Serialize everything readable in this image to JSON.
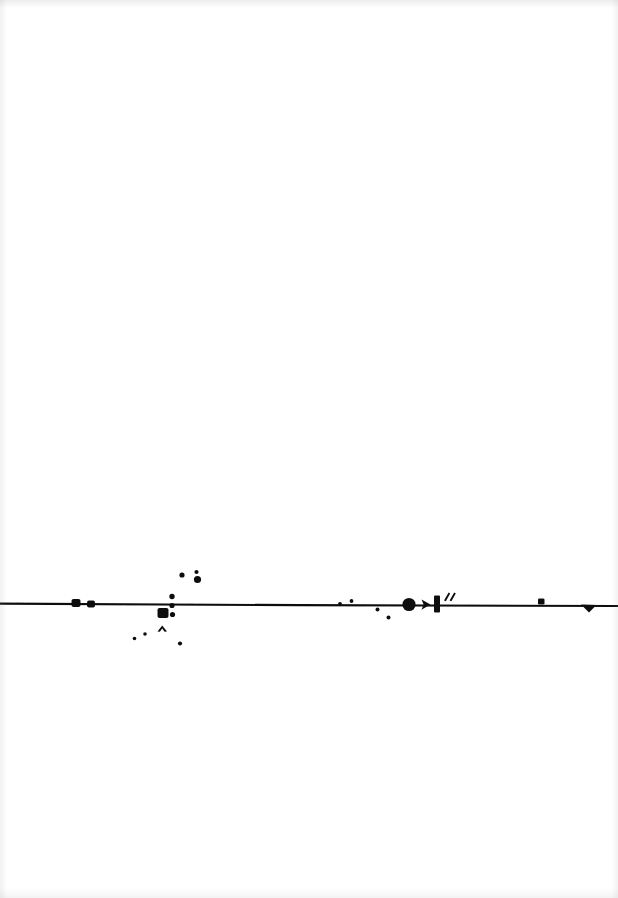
{
  "page": {
    "kind": "scanned-page",
    "width": 618,
    "height": 898,
    "background_color": "#ffffff",
    "ink_color": "#111111",
    "visible_text": "",
    "caption": ""
  },
  "artwork": {
    "title": "",
    "description": "horizontal ink rule with scattered blots",
    "baseline": {
      "name": "horizontal-rule",
      "x1": 0,
      "y1": 603.5,
      "x2": 618,
      "y2": 605.5,
      "stroke_width": 2.1
    },
    "marks": [
      {
        "name": "blot-square-left-1",
        "shape": "rounded-square",
        "x": 76,
        "y": 603,
        "w": 9,
        "h": 8
      },
      {
        "name": "blot-square-left-2",
        "shape": "rounded-square",
        "x": 91,
        "y": 604,
        "w": 8,
        "h": 7
      },
      {
        "name": "dot-upper-1",
        "shape": "dot",
        "x": 182,
        "y": 575,
        "w": 5,
        "h": 5
      },
      {
        "name": "dot-upper-2",
        "shape": "dot",
        "x": 196,
        "y": 572,
        "w": 4,
        "h": 4
      },
      {
        "name": "dot-upper-3",
        "shape": "dot",
        "x": 197,
        "y": 579,
        "w": 7,
        "h": 7
      },
      {
        "name": "dot-column-1",
        "shape": "dot",
        "x": 172,
        "y": 597,
        "w": 5,
        "h": 5
      },
      {
        "name": "dot-column-2",
        "shape": "dot",
        "x": 172,
        "y": 606,
        "w": 5,
        "h": 5
      },
      {
        "name": "dot-column-3",
        "shape": "dot",
        "x": 172,
        "y": 615,
        "w": 5,
        "h": 5
      },
      {
        "name": "blot-square-center",
        "shape": "rounded-square",
        "x": 163,
        "y": 613,
        "w": 11,
        "h": 10
      },
      {
        "name": "chevron-caret",
        "shape": "caret",
        "x": 162,
        "y": 628,
        "w": 10,
        "h": 6
      },
      {
        "name": "dot-lower-left-1",
        "shape": "dot",
        "x": 134,
        "y": 638,
        "w": 3.4,
        "h": 3.4
      },
      {
        "name": "dot-lower-left-2",
        "shape": "dot",
        "x": 145,
        "y": 634,
        "w": 3.4,
        "h": 3.4
      },
      {
        "name": "dot-lower-right",
        "shape": "dot",
        "x": 180,
        "y": 643,
        "w": 4,
        "h": 4
      },
      {
        "name": "dot-mid-1",
        "shape": "dot",
        "x": 340,
        "y": 604,
        "w": 3.6,
        "h": 3.6
      },
      {
        "name": "dot-mid-2",
        "shape": "dot",
        "x": 351,
        "y": 601,
        "w": 3.6,
        "h": 3.6
      },
      {
        "name": "dot-mid-3",
        "shape": "dot",
        "x": 377,
        "y": 609,
        "w": 3.8,
        "h": 3.8
      },
      {
        "name": "dot-mid-4",
        "shape": "dot",
        "x": 388,
        "y": 617,
        "w": 3.8,
        "h": 3.8
      },
      {
        "name": "blot-circle-large",
        "shape": "circle",
        "x": 409,
        "y": 604,
        "w": 13,
        "h": 13
      },
      {
        "name": "arrowhead-right",
        "shape": "arrowhead",
        "x": 426,
        "y": 604,
        "w": 9,
        "h": 9
      },
      {
        "name": "bar-vertical",
        "shape": "bar",
        "x": 437,
        "y": 603,
        "w": 6,
        "h": 17
      },
      {
        "name": "quote-ticks",
        "shape": "ticks",
        "x": 448,
        "y": 594,
        "w": 9,
        "h": 8
      },
      {
        "name": "blot-square-right",
        "shape": "rounded-square",
        "x": 541,
        "y": 602,
        "w": 6.5,
        "h": 6
      },
      {
        "name": "wedge-terminal",
        "shape": "wedge",
        "x": 589,
        "y": 606,
        "w": 15,
        "h": 8
      }
    ]
  }
}
